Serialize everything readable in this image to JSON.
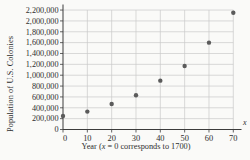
{
  "chart_data": {
    "type": "scatter",
    "title": "",
    "ylabel": "Population of U.S. Colonies",
    "xlabel": "Year (x = 0 corresponds to 1700)",
    "xlabel_prefix": "Year (",
    "xlabel_var": "x",
    "xlabel_suffix": " = 0 corresponds to 1700)",
    "x_axis_symbol": "x",
    "x": [
      0,
      10,
      20,
      30,
      40,
      50,
      60,
      70
    ],
    "y": [
      250000,
      330000,
      470000,
      630000,
      900000,
      1170000,
      1600000,
      2150000
    ],
    "xlim": [
      0,
      70
    ],
    "ylim": [
      0,
      2200000
    ],
    "xticks": [
      0,
      10,
      20,
      30,
      40,
      50,
      60,
      70
    ],
    "xtick_labels": [
      "0",
      "10",
      "20",
      "30",
      "40",
      "50",
      "60",
      "70"
    ],
    "yticks": [
      0,
      200000,
      400000,
      600000,
      800000,
      1000000,
      1200000,
      1400000,
      1600000,
      1800000,
      2000000,
      2200000
    ],
    "ytick_labels": [
      "0",
      "200,000",
      "400,000",
      "600,000",
      "800,000",
      "1,000,000",
      "1,200,000",
      "1,400,000",
      "1,600,000",
      "1,800,000",
      "2,000,000",
      "2,200,000"
    ],
    "grid": true,
    "legend": false,
    "colors": {
      "point": "#5b5b5b",
      "grid": "#c9c9c9",
      "axis": "#3c3c3c",
      "text": "#2e2e2e",
      "background": "#fafaf8"
    }
  }
}
